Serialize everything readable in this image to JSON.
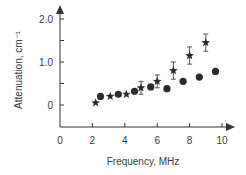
{
  "chart_data": {
    "type": "scatter",
    "title": "",
    "xlabel": "Frequency, MHz",
    "ylabel": "Attenuation, cm⁻¹",
    "xlim": [
      0,
      10.5
    ],
    "ylim": [
      -0.5,
      2.1
    ],
    "x_ticks": [
      0,
      2,
      4,
      6,
      8,
      10
    ],
    "x_tick_labels": [
      "0",
      "2",
      "4",
      "6",
      "8",
      "10"
    ],
    "y_ticks": [
      0,
      0.5,
      1.0,
      1.5,
      2.0
    ],
    "y_tick_labels": [
      "0",
      "",
      "1.0",
      "",
      "2.0"
    ],
    "grid": false,
    "legend": null,
    "series": [
      {
        "name": "stars",
        "marker": "star",
        "color": "#2b2b2b",
        "x": [
          2.2,
          3.1,
          4.1,
          5.0,
          6.0,
          7.0,
          8.0,
          9.0
        ],
        "y": [
          0.05,
          0.2,
          0.25,
          0.4,
          0.55,
          0.8,
          1.15,
          1.45
        ],
        "error": [
          0,
          0,
          0,
          0.15,
          0.15,
          0.2,
          0.2,
          0.2
        ]
      },
      {
        "name": "circles",
        "marker": "circle",
        "color": "#2b2b2b",
        "x": [
          2.5,
          3.6,
          4.6,
          5.6,
          6.6,
          7.6,
          8.6,
          9.6
        ],
        "y": [
          0.2,
          0.25,
          0.32,
          0.42,
          0.38,
          0.55,
          0.65,
          0.78
        ]
      }
    ]
  }
}
